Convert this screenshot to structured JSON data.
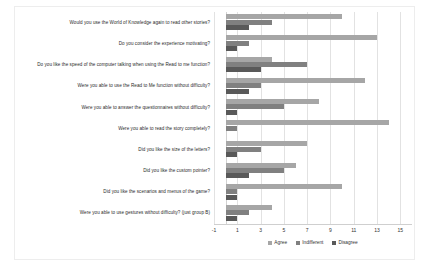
{
  "chart_data": {
    "type": "bar",
    "orientation": "horizontal",
    "title": "",
    "xlabel": "",
    "ylabel": "",
    "xlim": [
      -1,
      16
    ],
    "grid": true,
    "legend_position": "bottom-center",
    "xticks": [
      "-1",
      "1",
      "3",
      "5",
      "7",
      "9",
      "11",
      "13",
      "15"
    ],
    "categories": [
      "Would you use the World of Knowledge again to read other stories?",
      "Do you consider the experience motivating?",
      "Do you like the speed of the computer talking when using the Read to me function?",
      "Were you able to use the Read to Me function without difficulty?",
      "Were you able to answer the questionnaires without difficulty?",
      "Were you able to read the story completely?",
      "Did you like the size of the letters?",
      "Did you like the custom pointer?",
      "Did you like the scenarios and menus of the game?",
      "Were you able to use gestures without difficulty? (just group B)"
    ],
    "series": [
      {
        "name": "Agree",
        "color": "#a6a6a6",
        "values": [
          10,
          13,
          4,
          12,
          8,
          14,
          7,
          6,
          10,
          4
        ]
      },
      {
        "name": "Indifferent",
        "color": "#808080",
        "values": [
          4,
          2,
          7,
          3,
          5,
          1,
          3,
          5,
          1,
          2
        ]
      },
      {
        "name": "Disagree",
        "color": "#595959",
        "values": [
          2,
          1,
          3,
          2,
          1,
          0,
          1,
          2,
          1,
          1
        ]
      }
    ]
  },
  "legend": {
    "items": [
      {
        "label": "Agree"
      },
      {
        "label": "Indifferent"
      },
      {
        "label": "Disagree"
      }
    ]
  }
}
